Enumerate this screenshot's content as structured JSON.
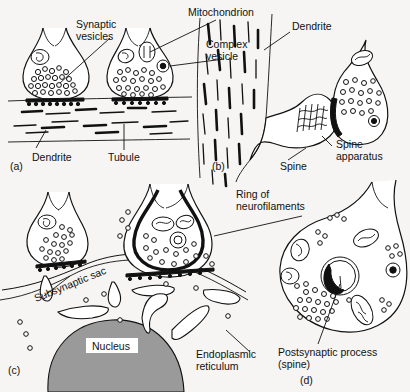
{
  "figure": {
    "background_color": "#f6f5f3",
    "ink_color": "#111111",
    "nucleus_fill": "#9a9a9a"
  },
  "panels": [
    {
      "id": "a",
      "marker": "(a)",
      "description": "Two axodendritic boutons on a dendrite containing tubules",
      "labels": [
        {
          "name": "synaptic-vesicles",
          "text_lines": [
            "Synaptic",
            "vesicles"
          ]
        },
        {
          "name": "mitochondrion",
          "text_lines": [
            "Mitochondrion"
          ]
        },
        {
          "name": "complex-vesicle",
          "text_lines": [
            "Complex",
            "vesicle"
          ]
        },
        {
          "name": "dendrite",
          "text_lines": [
            "Dendrite"
          ]
        },
        {
          "name": "tubule",
          "text_lines": [
            "Tubule"
          ]
        }
      ]
    },
    {
      "id": "b",
      "marker": "(b)",
      "description": "Dendritic shaft with a spine bearing a spine apparatus and an apposed bouton",
      "labels": [
        {
          "name": "dendrite",
          "text_lines": [
            "Dendrite"
          ]
        },
        {
          "name": "spine",
          "text_lines": [
            "Spine"
          ]
        },
        {
          "name": "spine-apparatus",
          "text_lines": [
            "Spine",
            "apparatus"
          ]
        }
      ]
    },
    {
      "id": "c",
      "marker": "(c)",
      "description": "Axosomatic synapses on a cell body showing nucleus, endoplasmic reticulum and subsynaptic sac",
      "labels": [
        {
          "name": "ring-of-neurofilaments",
          "text_lines": [
            "Ring of",
            "neurofilaments"
          ]
        },
        {
          "name": "subsynaptic-sac",
          "text_lines": [
            "Subsynaptic sac"
          ]
        },
        {
          "name": "nucleus",
          "text_lines": [
            "Nucleus"
          ]
        },
        {
          "name": "endoplasmic-reticulum",
          "text_lines": [
            "Endoplasmic",
            "reticulum"
          ]
        }
      ]
    },
    {
      "id": "d",
      "marker": "(d)",
      "description": "Large bouton enveloping a postsynaptic process (spine)",
      "labels": [
        {
          "name": "postsynaptic-process",
          "text_lines": [
            "Postsynaptic process",
            "(spine)"
          ]
        }
      ]
    }
  ],
  "text": {
    "synaptic_vesicles_1": "Synaptic",
    "synaptic_vesicles_2": "vesicles",
    "mitochondrion": "Mitochondrion",
    "complex_vesicle_1": "Complex",
    "complex_vesicle_2": "vesicle",
    "dendrite_a": "Dendrite",
    "tubule": "Tubule",
    "dendrite_b": "Dendrite",
    "spine": "Spine",
    "spine_apparatus_1": "Spine",
    "spine_apparatus_2": "apparatus",
    "ring_neurofil_1": "Ring of",
    "ring_neurofil_2": "neurofilaments",
    "subsynaptic_sac": "Subsynaptic sac",
    "nucleus": "Nucleus",
    "endoplasmic_1": "Endoplasmic",
    "endoplasmic_2": "reticulum",
    "postsynaptic_1": "Postsynaptic process",
    "postsynaptic_2": "(spine)",
    "marker_a": "(a)",
    "marker_b": "(b)",
    "marker_c": "(c)",
    "marker_d": "(d)"
  }
}
